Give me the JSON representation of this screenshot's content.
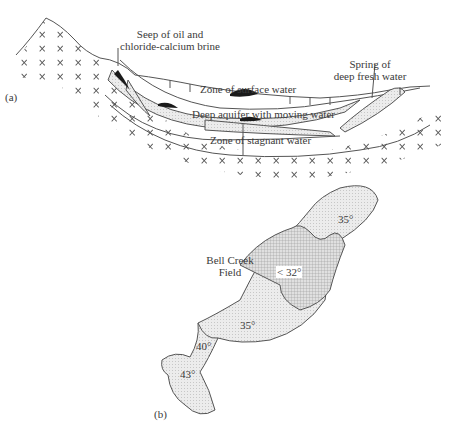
{
  "panel_a": {
    "label": "(a)",
    "callouts": {
      "seep_line1": "Seep of oil and",
      "seep_line2": "chloride-calcium brine",
      "spring_line1": "Spring of",
      "spring_line2": "deep fresh water"
    },
    "zones": {
      "surface": "Zone of surface water",
      "deep": "Deep aquifer with moving water",
      "stagnant": "Zone of stagnant water"
    }
  },
  "panel_b": {
    "label": "(b)",
    "field_line1": "Bell Creek",
    "field_line2": "Field",
    "regions": [
      {
        "name": "north-lobe",
        "value": "35°"
      },
      {
        "name": "core",
        "value": "< 32°"
      },
      {
        "name": "middle",
        "value": "35°"
      },
      {
        "name": "southwest-neck",
        "value": "40°"
      },
      {
        "name": "southwest-lobe",
        "value": "43°"
      }
    ]
  },
  "colors": {
    "line": "#555555",
    "fill_light": "#e4e4e4",
    "fill_hatch": "#cfcfcf",
    "oil": "#1a1a1a"
  }
}
